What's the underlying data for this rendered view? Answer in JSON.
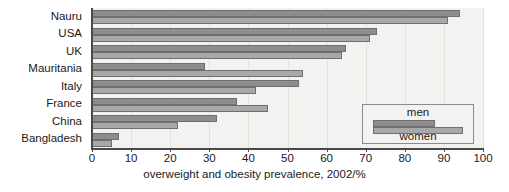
{
  "chart_data": {
    "type": "bar",
    "orientation": "horizontal",
    "title": "",
    "xlabel": "overweight and obesity prevalence, 2002/%",
    "ylabel": "",
    "xlim": [
      0,
      100
    ],
    "xticks": [
      0,
      10,
      20,
      30,
      40,
      50,
      60,
      70,
      80,
      90,
      100
    ],
    "grid": true,
    "legend_position": "bottom-right",
    "categories": [
      "Nauru",
      "USA",
      "UK",
      "Mauritania",
      "Italy",
      "France",
      "China",
      "Bangladesh"
    ],
    "series": [
      {
        "name": "men",
        "values": [
          94,
          73,
          65,
          29,
          53,
          37,
          32,
          7
        ]
      },
      {
        "name": "women",
        "values": [
          91,
          71,
          64,
          54,
          42,
          45,
          22,
          5
        ]
      }
    ]
  },
  "legend": {
    "men_label": "men",
    "women_label": "women"
  },
  "colors": {
    "men": "#8d8d8d",
    "women": "#a8a8a8",
    "plot_background": "#f2f2f0",
    "axis": "#4a4a4a",
    "grid": "#e2e2de"
  },
  "axis": {
    "x_title": "overweight and obesity prevalence, 2002/%",
    "tick_labels": [
      "0",
      "10",
      "20",
      "30",
      "40",
      "50",
      "60",
      "70",
      "80",
      "90",
      "100"
    ]
  }
}
